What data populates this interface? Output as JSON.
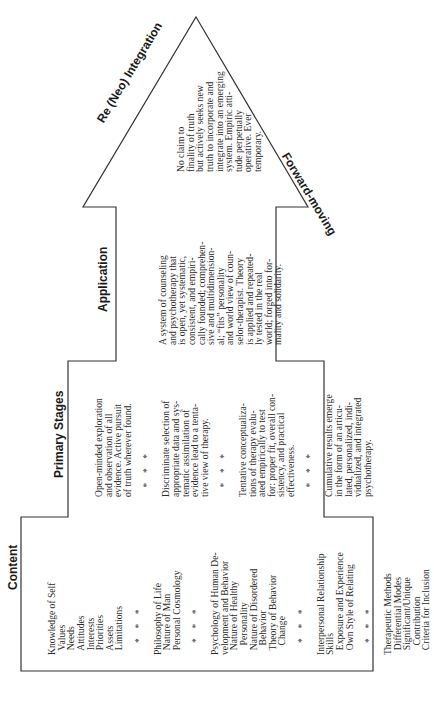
{
  "diagram": {
    "shape": "upward-arrow",
    "orientation": "rotated -90deg (text reads bottom-to-top)",
    "labels": {
      "tip_left": "Re (Neo) Integration",
      "tip_right": "Forward-moving"
    },
    "sections": {
      "tip": {
        "lines": [
          "No claim to",
          "finality of truth",
          "but actively seeks new",
          "truth to incorporate and",
          "integrate into an emerging",
          "system. Empiric atti-",
          "tude perpetually",
          "operative. Ever",
          "temporary."
        ]
      },
      "application": {
        "title": "Application",
        "lines": [
          "A system of counseling",
          "and psychotherapy that",
          "is open, yet systematic,",
          "consistent, and empiri-",
          "cally founded; comprehen-",
          "sive and multidimension-",
          "al; “fits” personality",
          "and world view of coun-",
          "selor-therapist. Theory",
          "is applied and repeated-",
          "ly tested in the real",
          "world; forged into for-",
          "mality and solidarity."
        ]
      },
      "primary_stages": {
        "title": "Primary Stages",
        "lines": [
          "Open-minded exploration",
          "and observation of all",
          "evidence. Active pursuit",
          "of truth wherever found.",
          "",
          "    *    *    *",
          "",
          "Discriminate selection of",
          "appropriate data and sys-",
          "tematic assimilation of",
          "evidence lead to a tenta-",
          "tive view of therapy.",
          "",
          "    *    *    *",
          "",
          "Tentative conceptualiza-",
          "tions of therapy evalu-",
          "ated empirically to test",
          "for: proper fit, overall con-",
          "sistency, and practical",
          "effectiveness.",
          "",
          "    *    *    *",
          "",
          "Cumulative results emerge",
          "in the form of an articu-",
          "lated, personalized, indi-",
          "vidualized, and integrated",
          "psychotherapy."
        ]
      },
      "content": {
        "title": "Content",
        "lines": [
          "Knowledge of Self",
          "  Values",
          "  Needs",
          "  Attitudes",
          "  Interests",
          "  Priorities",
          "  Assets",
          "  Limitations",
          "",
          "     *    *    *",
          "",
          "Philosophy of Life",
          "  Nature of Man",
          "  Personal Cosmology",
          "",
          "     *    *    *",
          "",
          "Psychology of Human De-",
          "velopment and Behavior",
          "  Nature of Healthy",
          "    Personality",
          "  Nature of Disordered",
          "    Behavior",
          "  Theory of Behavior",
          "    Change",
          "",
          "     *    *    *",
          "",
          "Interpersonal Relationship",
          "Skills",
          "  Exposure and Experience",
          "  Own Style of Relating",
          "",
          "     *    *    *",
          "",
          "Therapeutic Methods",
          "  Differential Modes",
          "  Significant/Unique",
          "    Contribution",
          "  Criteria for Inclusion"
        ]
      }
    }
  }
}
